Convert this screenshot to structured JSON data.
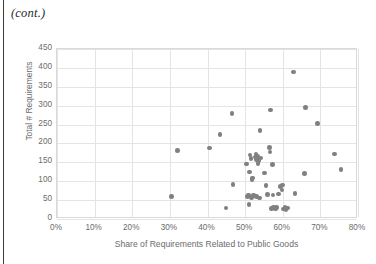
{
  "page": {
    "continuation_note": "(cont.)"
  },
  "chart_data": {
    "type": "scatter",
    "title": "",
    "xlabel": "Share of Requirements Related to Public Goods",
    "ylabel": "Total # Requirements",
    "xlim": [
      0,
      80
    ],
    "ylim": [
      0,
      450
    ],
    "xticks": [
      "0%",
      "10%",
      "20%",
      "30%",
      "40%",
      "50%",
      "60%",
      "70%",
      "80%"
    ],
    "xtick_values": [
      0,
      10,
      20,
      30,
      40,
      50,
      60,
      70,
      80
    ],
    "yticks": [
      "0",
      "50",
      "100",
      "150",
      "200",
      "250",
      "300",
      "350",
      "400",
      "450"
    ],
    "ytick_values": [
      0,
      50,
      100,
      150,
      200,
      250,
      300,
      350,
      400,
      450
    ],
    "grid": true,
    "legend": "none",
    "marker_color": "#808080",
    "marker_shape": "circle",
    "series": [
      {
        "name": "Constitutions",
        "points": [
          [
            30.5,
            60
          ],
          [
            32.0,
            182
          ],
          [
            40.6,
            188
          ],
          [
            43.3,
            223
          ],
          [
            44.9,
            29
          ],
          [
            46.5,
            279
          ],
          [
            46.8,
            91
          ],
          [
            50.4,
            146
          ],
          [
            50.6,
            60
          ],
          [
            50.9,
            63
          ],
          [
            51.0,
            38
          ],
          [
            51.1,
            124
          ],
          [
            51.3,
            169
          ],
          [
            51.6,
            160
          ],
          [
            51.7,
            57
          ],
          [
            51.8,
            105
          ],
          [
            51.9,
            108
          ],
          [
            52.2,
            63
          ],
          [
            52.4,
            61
          ],
          [
            52.7,
            164
          ],
          [
            52.9,
            172
          ],
          [
            53.0,
            158
          ],
          [
            53.1,
            59
          ],
          [
            53.3,
            166
          ],
          [
            53.4,
            147
          ],
          [
            53.6,
            155
          ],
          [
            53.8,
            56
          ],
          [
            54.0,
            235
          ],
          [
            54.2,
            161
          ],
          [
            55.2,
            122
          ],
          [
            55.6,
            89
          ],
          [
            56.0,
            65
          ],
          [
            56.4,
            189
          ],
          [
            56.6,
            177
          ],
          [
            56.8,
            288
          ],
          [
            57.0,
            28
          ],
          [
            57.2,
            145
          ],
          [
            57.4,
            63
          ],
          [
            57.6,
            31
          ],
          [
            58.0,
            26
          ],
          [
            58.4,
            30
          ],
          [
            58.8,
            66
          ],
          [
            59.4,
            86
          ],
          [
            59.8,
            77
          ],
          [
            60.0,
            90
          ],
          [
            60.2,
            27
          ],
          [
            60.6,
            31
          ],
          [
            60.9,
            24
          ],
          [
            61.2,
            29
          ],
          [
            62.9,
            389
          ],
          [
            63.3,
            68
          ],
          [
            65.8,
            120
          ],
          [
            66.1,
            295
          ],
          [
            69.2,
            253
          ],
          [
            73.8,
            172
          ],
          [
            75.5,
            131
          ]
        ]
      }
    ]
  }
}
